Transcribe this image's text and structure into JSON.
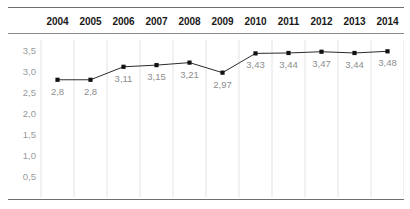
{
  "chart_data": {
    "type": "line",
    "title": "",
    "subtitle": "",
    "xlabel": "",
    "ylabel": "",
    "categories": [
      "2004",
      "2005",
      "2006",
      "2007",
      "2008",
      "2009",
      "2010",
      "2011",
      "2012",
      "2013",
      "2014"
    ],
    "values": [
      2.8,
      2.8,
      3.11,
      3.15,
      3.21,
      2.97,
      3.43,
      3.44,
      3.47,
      3.44,
      3.48
    ],
    "point_labels": [
      "2,8",
      "2,8",
      "3,11",
      "3,15",
      "3,21",
      "2,97",
      "3,43",
      "3,44",
      "3,47",
      "3,44",
      "3,48"
    ],
    "ylim": [
      0,
      3.75
    ],
    "yticks": [
      0.5,
      1.0,
      1.5,
      2.0,
      2.5,
      3.0,
      3.5
    ],
    "ytick_labels": [
      "0,5",
      "1,0",
      "1,5",
      "2,0",
      "2,5",
      "3,0",
      "3,5"
    ],
    "decimal_separator": ",",
    "grid": {
      "vertical": true,
      "horizontal": false
    },
    "legend": {
      "visible": false,
      "position": "none"
    },
    "series": [
      {
        "name": "",
        "values": [
          2.8,
          2.8,
          3.11,
          3.15,
          3.21,
          2.97,
          3.43,
          3.44,
          3.47,
          3.44,
          3.48
        ]
      }
    ],
    "colors": {
      "line": "#2b2b2b",
      "marker": "#111111",
      "gridline": "#e3e3e6",
      "rule": "#6f6f6f",
      "header_text": "#1a1a1a",
      "axis_text": "#9a9a9a",
      "label_text": "#8e8e8e",
      "background": "#ffffff"
    }
  }
}
